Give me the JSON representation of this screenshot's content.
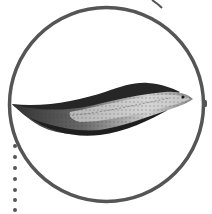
{
  "illustration": {
    "subject": "fish-in-circle",
    "description": "Grayscale engraving of an elongated fish inside a circular frame"
  },
  "colors": {
    "background": "#ffffff",
    "frame_stroke": "#555555",
    "fish_dark": "#1e1e1e",
    "fish_mid": "#6a6a6a",
    "fish_light": "#d8d8d8"
  },
  "decorations": {
    "dotted_line_dots": 6,
    "top_right_arc": true,
    "right_tick": true
  }
}
